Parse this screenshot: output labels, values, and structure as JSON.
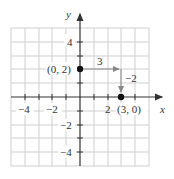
{
  "graph": {
    "axes": {
      "x_label": "x",
      "y_label": "y",
      "x_ticks": [
        {
          "value": -4,
          "label": "−4"
        },
        {
          "value": -2,
          "label": "−2"
        },
        {
          "value": 2,
          "label": "2"
        }
      ],
      "y_ticks": [
        {
          "value": 4,
          "label": "4"
        },
        {
          "value": -2,
          "label": "−2"
        },
        {
          "value": -4,
          "label": "−4"
        }
      ],
      "range": {
        "xmin": -5,
        "xmax": 5,
        "ymin": -5,
        "ymax": 5
      }
    },
    "points": [
      {
        "x": 0,
        "y": 2,
        "label": "(0, 2)"
      },
      {
        "x": 3,
        "y": 0,
        "label": "(3, 0)"
      }
    ],
    "steps": {
      "run_label": "3",
      "rise_label": "−2"
    },
    "colors": {
      "grid": "#cfcfcf",
      "axis": "#333333",
      "point": "#111111",
      "arrow": "#888888"
    }
  }
}
